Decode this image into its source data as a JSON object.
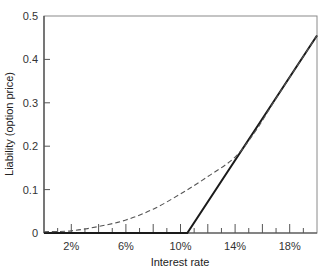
{
  "chart_data": {
    "type": "line",
    "title": "",
    "xlabel": "Interest rate",
    "ylabel": "Liability (option price)",
    "xlim": [
      0,
      20
    ],
    "ylim": [
      0,
      0.5
    ],
    "x_ticks": [
      2,
      6,
      10,
      14,
      18
    ],
    "x_tick_labels": [
      "2%",
      "6%",
      "10%",
      "14%",
      "18%"
    ],
    "y_ticks": [
      0,
      0.1,
      0.2,
      0.3,
      0.4,
      0.5
    ],
    "y_tick_labels": [
      "0",
      "0.1",
      "0.2",
      "0.3",
      "0.4",
      "0.5"
    ],
    "grid": false,
    "legend": null,
    "series": [
      {
        "name": "Payoff at expiry (intrinsic value)",
        "style": "solid",
        "color": "#1a1a1a",
        "x": [
          0,
          10.5,
          20
        ],
        "y": [
          0,
          0,
          0.455
        ]
      },
      {
        "name": "Option value before expiry",
        "style": "dashed",
        "color": "#555555",
        "x": [
          0,
          2,
          4,
          6,
          8,
          10,
          12,
          14,
          15.5,
          17,
          20
        ],
        "y": [
          0.003,
          0.005,
          0.015,
          0.03,
          0.055,
          0.09,
          0.13,
          0.175,
          0.235,
          0.31,
          0.455
        ]
      }
    ]
  }
}
